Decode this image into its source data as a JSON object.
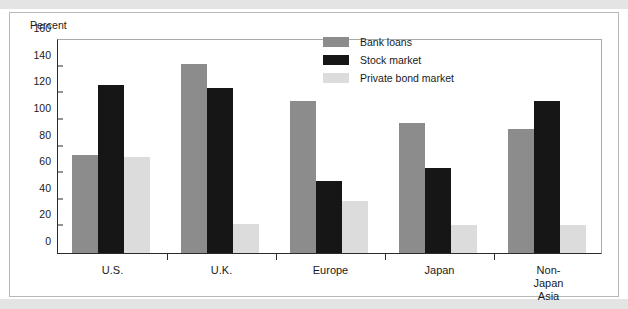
{
  "chart_data": {
    "type": "bar",
    "title": "",
    "subtitle": "",
    "xlabel": "",
    "ylabel": "Percent",
    "ylim": [
      0,
      160
    ],
    "yticks": [
      0,
      20,
      40,
      60,
      80,
      100,
      120,
      140,
      160
    ],
    "grid": false,
    "legend_position": "top-center-right",
    "categories": [
      "U.S.",
      "U.K.",
      "Europe",
      "Japan",
      "Non-Japan\nAsia"
    ],
    "series": [
      {
        "name": "Bank loans",
        "color": "#8c8c8c",
        "values": [
          74,
          142,
          114,
          98,
          93
        ]
      },
      {
        "name": "Stock market",
        "color": "#161616",
        "values": [
          126,
          124,
          54,
          64,
          114
        ]
      },
      {
        "name": "Private bond market",
        "color": "#dcdcdc",
        "values": [
          72,
          22,
          39,
          21,
          21
        ]
      }
    ]
  },
  "legend": {
    "items": [
      {
        "label": "Bank loans"
      },
      {
        "label": "Stock market"
      },
      {
        "label": "Private bond market"
      }
    ]
  },
  "axis": {
    "y_title": "Percent"
  }
}
